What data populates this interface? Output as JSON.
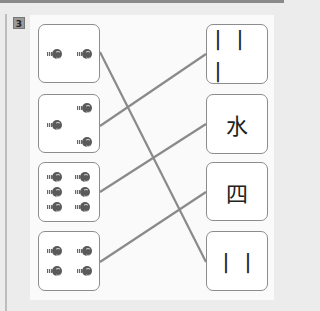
{
  "exercise": {
    "number": "3",
    "instruction_icon": "number-badge"
  },
  "left_items": [
    {
      "count": 2,
      "counters": [
        [
          8,
          24
        ],
        [
          38,
          24
        ]
      ]
    },
    {
      "count": 3,
      "counters": [
        [
          38,
          11
        ],
        [
          8,
          26
        ],
        [
          38,
          41
        ]
      ]
    },
    {
      "count": 6,
      "counters": [
        [
          8,
          9
        ],
        [
          36,
          9
        ],
        [
          8,
          24
        ],
        [
          36,
          24
        ],
        [
          8,
          39
        ],
        [
          36,
          39
        ]
      ]
    },
    {
      "count": 4,
      "counters": [
        [
          8,
          15
        ],
        [
          38,
          15
        ],
        [
          8,
          33
        ],
        [
          38,
          33
        ]
      ]
    }
  ],
  "right_items": [
    {
      "label": "川"
    },
    {
      "label": "水"
    },
    {
      "label": "四"
    },
    {
      "label": "川"
    }
  ],
  "right_display": [
    "丨丨丨",
    "水",
    "四",
    "丨丨"
  ],
  "connections": [
    {
      "from": 0,
      "to": 3
    },
    {
      "from": 1,
      "to": 0
    },
    {
      "from": 2,
      "to": 1
    },
    {
      "from": 3,
      "to": 2
    }
  ],
  "colors": {
    "line": "#8a8a8a",
    "box_border": "#8c8c8c",
    "background": "#fafafa"
  }
}
